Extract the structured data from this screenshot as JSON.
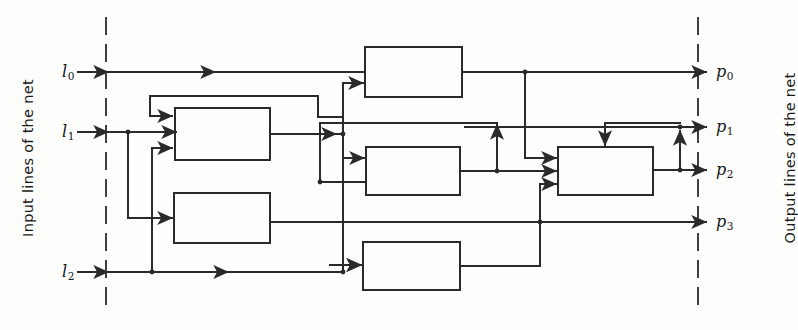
{
  "diagram": {
    "type": "block-diagram",
    "width": 798,
    "height": 330,
    "background_color": "#fdfdfc",
    "line_color": "#2a2a2a",
    "boundary_style": "dashed",
    "side_labels": {
      "input": "Input lines of the net",
      "output": "Output lines of the net"
    },
    "input_ports": [
      {
        "id": "l0",
        "base": "l",
        "sub": "0",
        "y": 72,
        "label_x": 62,
        "label_y": 62
      },
      {
        "id": "l1",
        "base": "l",
        "sub": "1",
        "y": 132,
        "label_x": 62,
        "label_y": 122
      },
      {
        "id": "l2",
        "base": "l",
        "sub": "2",
        "y": 272,
        "label_x": 62,
        "label_y": 262
      }
    ],
    "output_ports": [
      {
        "id": "p0",
        "base": "p",
        "sub": "0",
        "y": 72,
        "label_x": 716,
        "label_y": 62
      },
      {
        "id": "p1",
        "base": "p",
        "sub": "1",
        "y": 127,
        "label_x": 716,
        "label_y": 117
      },
      {
        "id": "p2",
        "base": "p",
        "sub": "2",
        "y": 170,
        "label_x": 716,
        "label_y": 160
      },
      {
        "id": "p3",
        "base": "p",
        "sub": "3",
        "y": 222,
        "label_x": 716,
        "label_y": 212
      }
    ],
    "boundaries": [
      {
        "id": "input-boundary",
        "x": 106,
        "y1": 18,
        "y2": 312
      },
      {
        "id": "output-boundary",
        "x": 698,
        "y1": 18,
        "y2": 312
      }
    ],
    "blocks": [
      {
        "id": "block-1",
        "x": 365,
        "y": 47,
        "w": 97,
        "h": 50
      },
      {
        "id": "block-2",
        "x": 175,
        "y": 108,
        "w": 95,
        "h": 52
      },
      {
        "id": "block-3",
        "x": 174,
        "y": 193,
        "w": 96,
        "h": 50
      },
      {
        "id": "block-4",
        "x": 366,
        "y": 147,
        "w": 94,
        "h": 48
      },
      {
        "id": "block-5",
        "x": 363,
        "y": 242,
        "w": 97,
        "h": 48
      },
      {
        "id": "block-6",
        "x": 558,
        "y": 147,
        "w": 95,
        "h": 48
      }
    ]
  }
}
